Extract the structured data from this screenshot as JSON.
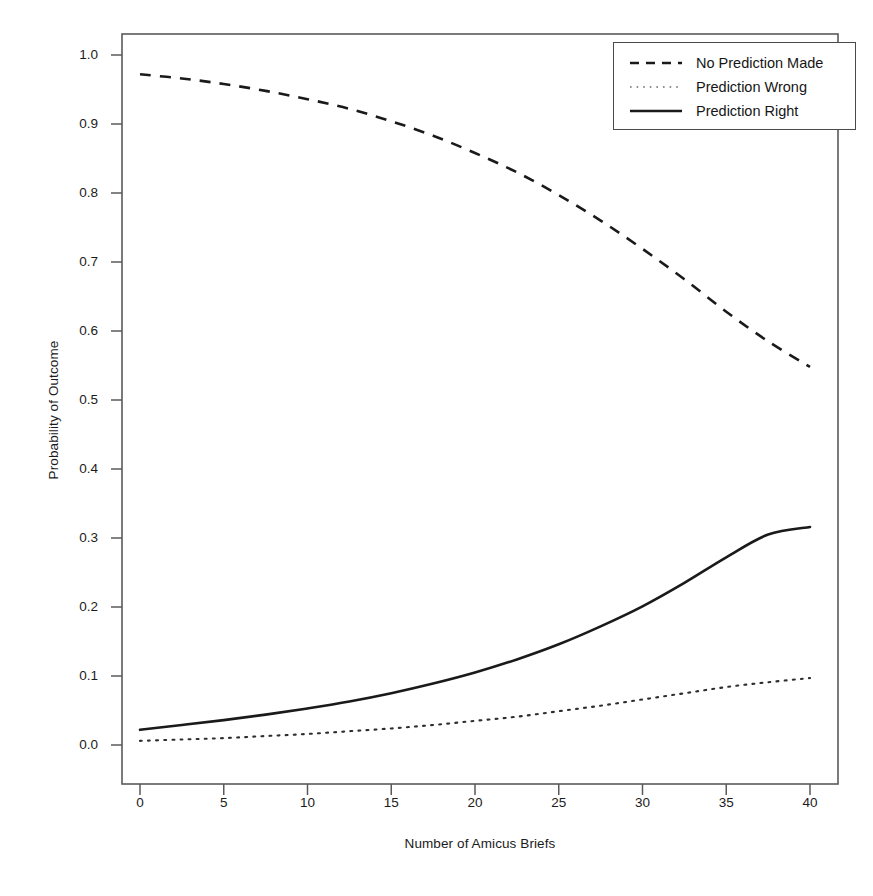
{
  "chart_data": {
    "type": "line",
    "title": "",
    "xlabel": "Number of Amicus Briefs",
    "ylabel": "Probability of Outcome",
    "xlim": [
      0,
      41.5
    ],
    "ylim": [
      -0.015,
      1.03
    ],
    "xticks": [
      0,
      5,
      10,
      15,
      20,
      25,
      30,
      35,
      40
    ],
    "xtick_labels": [
      "0",
      "5",
      "10",
      "15",
      "20",
      "25",
      "30",
      "35",
      "40"
    ],
    "yticks": [
      0.0,
      0.1,
      0.2,
      0.3,
      0.4,
      0.5,
      0.6,
      0.7,
      0.8,
      0.9,
      1.0
    ],
    "ytick_labels": [
      "0.0",
      "0.1",
      "0.2",
      "0.3",
      "0.4",
      "0.5",
      "0.6",
      "0.7",
      "0.8",
      "0.9",
      "1.0"
    ],
    "grid": false,
    "legend_position": "top-right",
    "x": [
      0,
      2.5,
      5,
      7.5,
      10,
      12.5,
      15,
      17.5,
      20,
      22.5,
      25,
      27.5,
      30,
      32.5,
      35,
      37.5,
      40
    ],
    "series": [
      {
        "name": "No Prediction Made",
        "style": "dashed",
        "color": "#1a1a1a",
        "values": [
          0.972,
          0.966,
          0.958,
          0.948,
          0.936,
          0.922,
          0.904,
          0.883,
          0.858,
          0.83,
          0.797,
          0.76,
          0.719,
          0.675,
          0.628,
          0.585,
          0.548
        ]
      },
      {
        "name": "Prediction Wrong",
        "style": "dotted",
        "color": "#1a1a1a",
        "values": [
          0.006,
          0.008,
          0.01,
          0.013,
          0.016,
          0.02,
          0.024,
          0.029,
          0.035,
          0.041,
          0.049,
          0.057,
          0.066,
          0.075,
          0.084,
          0.091,
          0.097
        ]
      },
      {
        "name": "Prediction Right",
        "style": "solid",
        "color": "#1a1a1a",
        "values": [
          0.022,
          0.029,
          0.036,
          0.044,
          0.053,
          0.063,
          0.075,
          0.089,
          0.105,
          0.124,
          0.146,
          0.172,
          0.201,
          0.235,
          0.272,
          0.305,
          0.316
        ]
      }
    ]
  },
  "axes": {
    "xlabel": "Number of Amicus Briefs",
    "ylabel": "Probability of Outcome"
  },
  "legend": {
    "entries": [
      {
        "label": "No Prediction Made",
        "style": "dashed"
      },
      {
        "label": "Prediction Wrong",
        "style": "dotted"
      },
      {
        "label": "Prediction Right",
        "style": "solid"
      }
    ]
  }
}
